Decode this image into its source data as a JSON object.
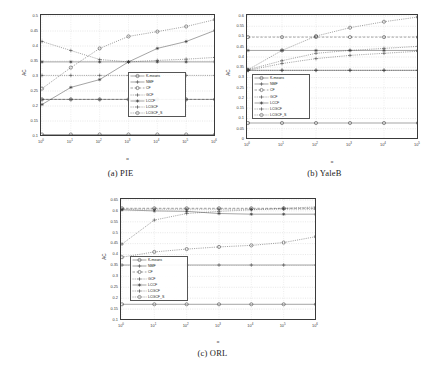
{
  "figure": {
    "panels": [
      {
        "id": "pie",
        "caption": "(a) PIE"
      },
      {
        "id": "yaleb",
        "caption": "(b) YaleB"
      },
      {
        "id": "orl",
        "caption": "(c) ORL"
      }
    ]
  },
  "chart_data": [
    {
      "type": "line",
      "title": "(a) PIE",
      "xlabel": "α",
      "ylabel": "AC",
      "xscale": "log",
      "x": [
        1,
        10,
        100,
        1000,
        10000,
        100000,
        1000000
      ],
      "xtick_labels": [
        "10^0",
        "10^1",
        "10^2",
        "10^3",
        "10^4",
        "10^5",
        "10^6"
      ],
      "ylim": [
        0.1,
        0.5
      ],
      "ytick_labels": [
        "0.1",
        "0.15",
        "0.2",
        "0.25",
        "0.3",
        "0.35",
        "0.4",
        "0.45",
        "0.5"
      ],
      "grid": true,
      "legend_position": "lower-right",
      "series": [
        {
          "name": "K-means",
          "marker": "circle",
          "style": "solid",
          "values": [
            0.105,
            0.105,
            0.105,
            0.105,
            0.105,
            0.105,
            0.105
          ]
        },
        {
          "name": "NMF",
          "marker": "plus",
          "style": "solid",
          "values": [
            0.222,
            0.222,
            0.222,
            0.222,
            0.222,
            0.222,
            0.222
          ]
        },
        {
          "name": "CF",
          "marker": "circle",
          "style": "dashed",
          "values": [
            0.222,
            0.222,
            0.222,
            0.222,
            0.222,
            0.222,
            0.222
          ]
        },
        {
          "name": "GCF",
          "marker": "plus",
          "style": "dotted",
          "values": [
            0.302,
            0.302,
            0.302,
            0.302,
            0.302,
            0.302,
            0.302
          ]
        },
        {
          "name": "LCCF",
          "marker": "star",
          "style": "solid",
          "values": [
            0.347,
            0.347,
            0.347,
            0.347,
            0.347,
            0.347,
            0.347
          ]
        },
        {
          "name": "LCGCF",
          "marker": "plus",
          "style": "dotted",
          "values": [
            0.415,
            0.385,
            0.355,
            0.347,
            0.352,
            0.356,
            0.362
          ]
        },
        {
          "name": "LCGCF_S",
          "marker": "circle",
          "style": "dotted",
          "values": [
            0.258,
            0.328,
            0.392,
            0.432,
            0.448,
            0.465,
            0.488
          ]
        }
      ],
      "extra_series": [
        {
          "name": "LCGCF-rising",
          "marker": "star",
          "style": "solid",
          "values": [
            0.205,
            0.262,
            0.288,
            0.347,
            0.392,
            0.415,
            0.452
          ]
        }
      ]
    },
    {
      "type": "line",
      "title": "(b) YaleB",
      "xlabel": "α",
      "ylabel": "AC",
      "xscale": "log",
      "x": [
        1,
        10,
        100,
        1000,
        10000,
        100000
      ],
      "xtick_labels": [
        "10^0",
        "10^1",
        "10^2",
        "10^3",
        "10^4",
        "10^5"
      ],
      "ylim": [
        0,
        0.6
      ],
      "ytick_labels": [
        "0",
        "0.05",
        "0.1",
        "0.15",
        "0.2",
        "0.25",
        "0.3",
        "0.35",
        "0.4",
        "0.45",
        "0.5",
        "0.55",
        "0.6"
      ],
      "grid": true,
      "legend_position": "lower-left",
      "series": [
        {
          "name": "K-means",
          "marker": "circle",
          "style": "solid",
          "values": [
            0.078,
            0.078,
            0.078,
            0.078,
            0.078,
            0.078
          ]
        },
        {
          "name": "NMF",
          "marker": "plus",
          "style": "solid",
          "values": [
            0.335,
            0.335,
            0.335,
            0.335,
            0.335,
            0.335
          ]
        },
        {
          "name": "CF",
          "marker": "circle",
          "style": "dashed",
          "values": [
            0.497,
            0.497,
            0.497,
            0.497,
            0.497,
            0.497
          ]
        },
        {
          "name": "GCF",
          "marker": "plus",
          "style": "dotted",
          "values": [
            0.335,
            0.335,
            0.335,
            0.335,
            0.335,
            0.335
          ]
        },
        {
          "name": "LCCF",
          "marker": "star",
          "style": "solid",
          "values": [
            0.432,
            0.432,
            0.432,
            0.432,
            0.432,
            0.432
          ]
        },
        {
          "name": "LCGCF",
          "marker": "plus",
          "style": "dotted",
          "values": [
            0.338,
            0.382,
            0.418,
            0.432,
            0.442,
            0.452
          ]
        },
        {
          "name": "LCGCF_S",
          "marker": "circle",
          "style": "dotted",
          "values": [
            0.338,
            0.432,
            0.502,
            0.543,
            0.572,
            0.595
          ]
        }
      ],
      "extra_series": [
        {
          "name": "LCGCF-low",
          "marker": "plus",
          "style": "dotted",
          "values": [
            0.335,
            0.368,
            0.392,
            0.408,
            0.418,
            0.428
          ]
        }
      ]
    },
    {
      "type": "line",
      "title": "(c) ORL",
      "xlabel": "α",
      "ylabel": "AC",
      "xscale": "log",
      "x": [
        1,
        10,
        100,
        1000,
        10000,
        100000,
        1000000
      ],
      "xtick_labels": [
        "10^0",
        "10^1",
        "10^2",
        "10^3",
        "10^4",
        "10^5",
        "10^6"
      ],
      "ylim": [
        0.1,
        0.65
      ],
      "ytick_labels": [
        "0.1",
        "0.15",
        "0.2",
        "0.25",
        "0.3",
        "0.35",
        "0.4",
        "0.45",
        "0.5",
        "0.55",
        "0.6",
        "0.65"
      ],
      "grid": true,
      "legend_position": "lower-left",
      "series": [
        {
          "name": "K-means",
          "marker": "circle",
          "style": "solid",
          "values": [
            0.172,
            0.172,
            0.172,
            0.172,
            0.172,
            0.172,
            0.172
          ]
        },
        {
          "name": "NMF",
          "marker": "plus",
          "style": "solid",
          "values": [
            0.352,
            0.352,
            0.352,
            0.352,
            0.352,
            0.352,
            0.352
          ]
        },
        {
          "name": "CF",
          "marker": "circle",
          "style": "dashed",
          "values": [
            0.612,
            0.612,
            0.612,
            0.612,
            0.612,
            0.612,
            0.612
          ]
        },
        {
          "name": "GCF",
          "marker": "plus",
          "style": "dotted",
          "values": [
            0.608,
            0.608,
            0.608,
            0.608,
            0.608,
            0.608,
            0.608
          ]
        },
        {
          "name": "LCCF",
          "marker": "star",
          "style": "solid",
          "values": [
            0.605,
            0.6,
            0.598,
            0.588,
            0.585,
            0.585,
            0.585
          ]
        },
        {
          "name": "LCGCF",
          "marker": "plus",
          "style": "dotted",
          "values": [
            0.448,
            0.558,
            0.588,
            0.598,
            0.605,
            0.612,
            0.618
          ]
        },
        {
          "name": "LCGCF_S",
          "marker": "circle",
          "style": "dotted",
          "values": [
            0.388,
            0.412,
            0.425,
            0.435,
            0.442,
            0.455,
            0.482
          ]
        }
      ],
      "extra_series": []
    }
  ],
  "legend": {
    "labels": [
      "K-means",
      "NMF",
      "CF",
      "GCF",
      "LCCF",
      "LCGCF",
      "LCGCF_S"
    ]
  }
}
